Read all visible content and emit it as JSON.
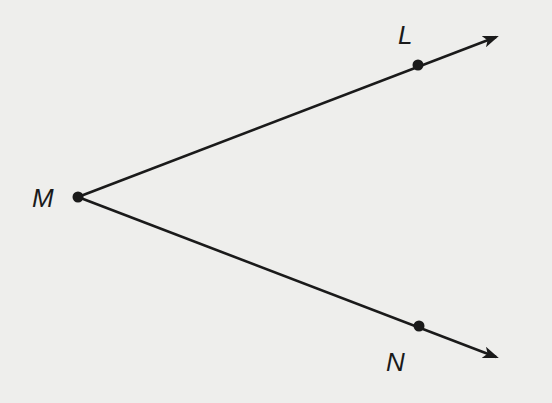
{
  "diagram": {
    "type": "angle",
    "colors": {
      "background": "#eeeeec",
      "stroke": "#1a1a1a"
    },
    "points": [
      {
        "id": "M",
        "label": "M",
        "x": 78,
        "y": 197,
        "role": "vertex"
      },
      {
        "id": "L",
        "label": "L",
        "x": 418,
        "y": 65,
        "role": "point-on-ray"
      },
      {
        "id": "N",
        "label": "N",
        "x": 419,
        "y": 326,
        "role": "point-on-ray"
      }
    ],
    "rays": [
      {
        "id": "ray-ML",
        "from": "M",
        "through": "L",
        "end": [
          496,
          37
        ]
      },
      {
        "id": "ray-MN",
        "from": "M",
        "through": "N",
        "end": [
          496,
          357
        ]
      }
    ],
    "labels": {
      "M": "M",
      "L": "L",
      "N": "N"
    }
  }
}
